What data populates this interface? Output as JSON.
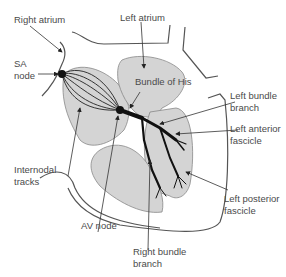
{
  "diagram": {
    "colors": {
      "chamber_fill": "#d4d4d4",
      "outline": "#555555",
      "conduction": "#111111",
      "text": "#4a4a4a"
    },
    "labels": {
      "right_atrium": "Right atrium",
      "left_atrium": "Left atrium",
      "sa_node_line1": "SA",
      "sa_node_line2": "node",
      "bundle_of_his": "Bundle of His",
      "left_bundle_branch_line1": "Left bundle",
      "left_bundle_branch_line2": "branch",
      "left_anterior_fascicle_line1": "Left anterior",
      "left_anterior_fascicle_line2": "fascicle",
      "internodal_tracks_line1": "Internodal",
      "internodal_tracks_line2": "tracks",
      "av_node": "AV node",
      "left_posterior_fascicle_line1": "Left posterior",
      "left_posterior_fascicle_line2": "fascicle",
      "right_bundle_branch_line1": "Right bundle",
      "right_bundle_branch_line2": "branch"
    }
  }
}
